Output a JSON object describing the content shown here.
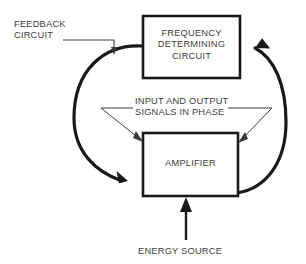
{
  "diagram": {
    "colors": {
      "line": "#1a1a1a",
      "thin_line": "#3a3a3a",
      "text": "#3d3d3d",
      "background": "#ffffff"
    },
    "blocks": [
      {
        "id": "frequency-determining-circuit",
        "label": "FREQUENCY\nDETERMINING\nCIRCUIT",
        "x": 143,
        "y": 16,
        "width": 97,
        "height": 62
      },
      {
        "id": "amplifier",
        "label": "AMPLIFIER",
        "x": 143,
        "y": 133,
        "width": 95,
        "height": 63
      }
    ],
    "annotations": [
      {
        "id": "feedback-circuit",
        "label": "FEEDBACK\nCIRCUIT"
      },
      {
        "id": "phase-note",
        "label": "INPUT AND OUTPUT\nSIGNALS IN PHASE"
      },
      {
        "id": "energy-source",
        "label": "ENERGY SOURCE"
      }
    ],
    "connectors": [
      {
        "id": "feedback-path-left",
        "from": "frequency-determining-circuit",
        "to": "amplifier",
        "style": "thick-curve-arrow"
      },
      {
        "id": "output-path-right",
        "from": "amplifier",
        "to": "frequency-determining-circuit",
        "style": "thick-curve-arrow"
      },
      {
        "id": "energy-source-arrow",
        "from": "energy-source",
        "to": "amplifier",
        "style": "straight-arrow"
      }
    ]
  }
}
